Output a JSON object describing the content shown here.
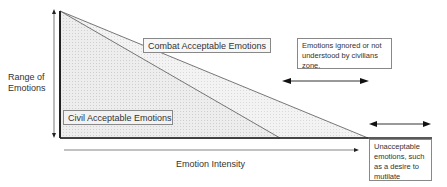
{
  "diagram": {
    "y_axis_label_line1": "Range of",
    "y_axis_label_line2": "Emotions",
    "x_axis_label": "Emotion Intensity",
    "combat_label": "Combat Acceptable Emotions",
    "civil_label": "Civil Acceptable Emotions",
    "ignored_note": "Emotions ignored or not understood by civilians zone.",
    "unacceptable_note": "Unacceptable emotions, such as a desire to mutilate",
    "colors": {
      "line": "#333333",
      "fill_outer": "#ebebeb",
      "fill_inner": "#e0e0e0",
      "box_border": "#888888"
    }
  }
}
